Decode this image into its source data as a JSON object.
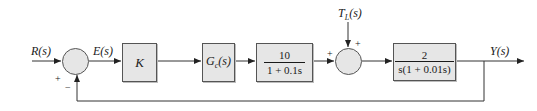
{
  "diagram": {
    "type": "block-diagram",
    "colors": {
      "line": "#333333",
      "block_fill": "#e6e6e6",
      "block_border": "#555555",
      "text": "#1a1a1a"
    },
    "signals": {
      "input": "R(s)",
      "error": "E(s)",
      "disturbance": "T_L(s)",
      "output": "Y(s)"
    },
    "blocks": [
      {
        "id": "gain",
        "text": "K"
      },
      {
        "id": "controller",
        "text": "Gc(s)"
      },
      {
        "id": "actuator",
        "numerator": "10",
        "denominator": "1 + 0.1s"
      },
      {
        "id": "plant",
        "numerator": "2",
        "denominator": "s(1 + 0.01s)"
      }
    ],
    "summing_junctions": [
      {
        "id": "sum1",
        "signs": {
          "input": "+",
          "feedback": "−"
        }
      },
      {
        "id": "sum2",
        "signs": {
          "left": "+",
          "top": "+"
        }
      }
    ]
  }
}
